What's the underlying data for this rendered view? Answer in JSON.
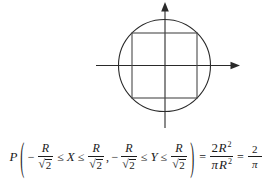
{
  "figure": {
    "axes": {
      "x_axis_label": "",
      "y_axis_label": "",
      "x_arrow": "right-arrow",
      "y_arrow": "up-arrow"
    },
    "shapes": {
      "circle": {
        "label": "circle",
        "center_x": 164,
        "center_y": 65,
        "radius": 46
      },
      "square": {
        "label": "inscribed-square",
        "left": 132,
        "top": 33,
        "right": 197,
        "bottom": 98
      }
    },
    "stroke_color": "#222222",
    "background_color": "#ffffff"
  },
  "equation": {
    "probability_symbol": "P",
    "open_paren": "(",
    "close_paren": ")",
    "minus": "−",
    "comma": ",",
    "leq": "≤",
    "equals": "=",
    "variable_x": "X",
    "variable_y": "Y",
    "radius_symbol": "R",
    "radical": "√",
    "two": "2",
    "pi": "π",
    "exponent_two": "2",
    "result_numerator": "2",
    "result_denominator": "π",
    "plain_text": "P(−R/√2 ≤ X ≤ R/√2, −R/√2 ≤ Y ≤ R/√2) = 2R²/πR² = 2/π"
  }
}
